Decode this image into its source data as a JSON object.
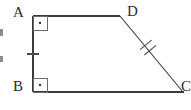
{
  "figure": {
    "type": "geometry-diagram",
    "shape_name": "quadrilateral ABCD",
    "stroke_color": "#3a3a3a",
    "label_color": "#2b2b2b",
    "background_color": "#ffffff",
    "vertices": [
      {
        "name": "A",
        "label": "A",
        "x": 33,
        "y": 16,
        "label_x": 13,
        "label_y": 5
      },
      {
        "name": "B",
        "label": "B",
        "x": 33,
        "y": 92,
        "label_x": 13,
        "label_y": 79
      },
      {
        "name": "C",
        "label": "C",
        "x": 182,
        "y": 92,
        "label_x": 181,
        "label_y": 79,
        "clipped": "true"
      },
      {
        "name": "D",
        "label": "D",
        "x": 120,
        "y": 16,
        "label_x": 127,
        "label_y": 4
      }
    ],
    "edges": [
      {
        "name": "AD",
        "from": "A",
        "to": "D",
        "x1": 33,
        "y1": 16,
        "x2": 120,
        "y2": 16,
        "ticks": 0
      },
      {
        "name": "DC",
        "from": "D",
        "to": "C",
        "x1": 120,
        "y1": 16,
        "x2": 182,
        "y2": 92,
        "ticks": 2
      },
      {
        "name": "BC",
        "from": "B",
        "to": "C",
        "x1": 33,
        "y1": 92,
        "x2": 182,
        "y2": 92,
        "ticks": 0
      },
      {
        "name": "AB",
        "from": "A",
        "to": "B",
        "x1": 33,
        "y1": 16,
        "x2": 33,
        "y2": 92,
        "ticks": 1
      }
    ],
    "right_angles": [
      {
        "name": "angle-A",
        "vertex": "A",
        "marker": "square-with-dot",
        "size": 14
      },
      {
        "name": "angle-B",
        "vertex": "B",
        "marker": "square-with-dot",
        "size": 14
      }
    ],
    "tick_marks": [
      {
        "name": "tick-AB",
        "on_edge": "AB",
        "count": 1,
        "x": 33,
        "y": 54
      },
      {
        "name": "tick-DC",
        "on_edge": "DC",
        "count": 2,
        "x": 148,
        "y": 51
      }
    ],
    "clipped_artifacts": [
      {
        "name": "artifact-upper",
        "x": 0,
        "y": 29,
        "width": 3,
        "height": 7
      },
      {
        "name": "artifact-lower",
        "x": 0,
        "y": 56,
        "width": 3,
        "height": 6
      }
    ]
  }
}
